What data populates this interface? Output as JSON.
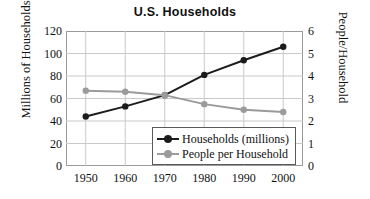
{
  "chart_data": {
    "type": "line",
    "title": "U.S. Households",
    "xlabel": "",
    "ylabel": "Millions of Households",
    "ylabel_right": "People/Household",
    "x": [
      1950,
      1960,
      1970,
      1980,
      1990,
      2000
    ],
    "categories": [
      "1950",
      "1960",
      "1970",
      "1980",
      "1990",
      "2000"
    ],
    "series": [
      {
        "name": "Households (millions)",
        "axis": "left",
        "color": "#1c1c1c",
        "marker": "circle",
        "values": [
          44,
          53,
          63,
          81,
          94,
          106
        ]
      },
      {
        "name": "People per Household",
        "axis": "right",
        "color": "#9b9b9b",
        "marker": "circle",
        "values": [
          3.35,
          3.3,
          3.15,
          2.75,
          2.5,
          2.4
        ]
      }
    ],
    "ylim": [
      0,
      120
    ],
    "ylim_right": [
      0,
      6
    ],
    "yticks": [
      0,
      20,
      40,
      60,
      80,
      100,
      120
    ],
    "yticks_right": [
      0,
      1,
      2,
      3,
      4,
      5,
      6
    ],
    "ytick_labels": [
      "0",
      "20",
      "40",
      "60",
      "80",
      "100",
      "120"
    ],
    "ytick_labels_right": [
      "0",
      "1",
      "2",
      "3",
      "4",
      "5",
      "6"
    ],
    "xtick_labels": [
      "1950",
      "1960",
      "1970",
      "1980",
      "1990",
      "2000"
    ],
    "grid": true,
    "grid_color": "#c9c9c9",
    "legend_position": "lower-right-inside",
    "legend_entries": [
      "Households (millions)",
      "People per Household"
    ],
    "frame_color": "#9a9a9a",
    "background": "#ffffff"
  }
}
